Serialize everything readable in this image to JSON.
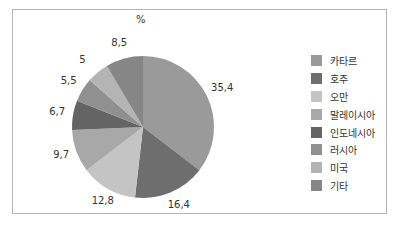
{
  "chart_data": {
    "type": "pie",
    "title": "%",
    "categories": [
      "카타르",
      "호주",
      "오만",
      "말레이시아",
      "인도네시아",
      "러시아",
      "미국",
      "기타"
    ],
    "values": [
      35.4,
      16.4,
      12.8,
      9.7,
      6.7,
      5.5,
      5,
      8.5
    ],
    "value_labels": [
      "35,4",
      "16,4",
      "12,8",
      "9,7",
      "6,7",
      "5,5",
      "5",
      "8,5"
    ],
    "colors": [
      "#9a9a9a",
      "#6e6e6e",
      "#c4c4c4",
      "#a8a8a8",
      "#646464",
      "#909090",
      "#b4b4b4",
      "#868686"
    ],
    "start_angle": "12 o'clock",
    "direction": "clockwise",
    "legend_position": "right"
  },
  "legend": {
    "items": [
      {
        "label": "카타르"
      },
      {
        "label": "호주"
      },
      {
        "label": "오만"
      },
      {
        "label": "말레이시아"
      },
      {
        "label": "인도네시아"
      },
      {
        "label": "러시아"
      },
      {
        "label": "미국"
      },
      {
        "label": "기타"
      }
    ]
  }
}
